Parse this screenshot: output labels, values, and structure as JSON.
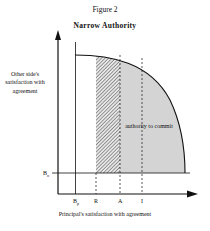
{
  "figure": {
    "number": "Figure 2",
    "title": "Narrow Authority",
    "y_axis_label": "Other side's satisfaction with agreement",
    "x_axis_label": "Principal's satisfaction with agreement",
    "y_marker": "B",
    "y_marker_sub": "o",
    "x_markers": [
      {
        "label": "B",
        "sub": "p"
      },
      {
        "label": "R",
        "sub": ""
      },
      {
        "label": "A",
        "sub": ""
      },
      {
        "label": "I",
        "sub": ""
      }
    ],
    "region_label": "authority to commit",
    "colors": {
      "shaded": "#d4d4d4",
      "hatch": "#555555",
      "line": "#111111"
    }
  }
}
